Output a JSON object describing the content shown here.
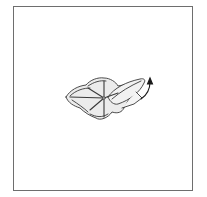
{
  "diagram": {
    "type": "origami-fold-step",
    "frame": {
      "border_color": "#6e6e6e",
      "background": "#ffffff"
    },
    "model": {
      "fill_color": "#ececec",
      "stroke_color": "#3a3a3a",
      "crease_count": 6
    },
    "arrow": {
      "direction": "up",
      "meaning": "lift flap",
      "color": "#1a1a1a"
    }
  }
}
